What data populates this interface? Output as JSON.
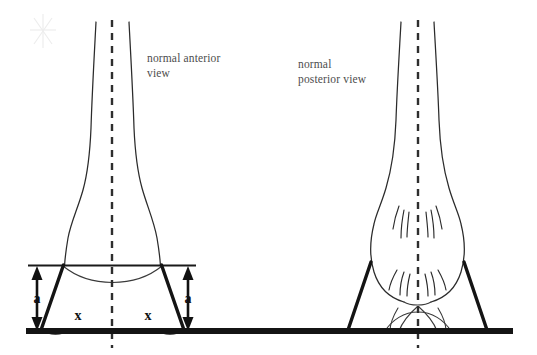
{
  "figure": {
    "background_color": "#ffffff",
    "ink_color": "#2b2b2b",
    "label_color": "#4d4d4d"
  },
  "labels": {
    "left_view_line1": "normal anterior",
    "left_view_line2": "view",
    "right_view_line1": "normal",
    "right_view_line2": "posterior  view"
  },
  "annotations": {
    "height_left": "a",
    "height_right": "a",
    "angle_left": "x",
    "angle_right": "x"
  },
  "panels": [
    {
      "name": "anterior-panel",
      "label_line1": "normal anterior",
      "label_line2": "view",
      "center_axis_x": 112,
      "has_angle_marks": true,
      "has_height_marks": true
    },
    {
      "name": "posterior-panel",
      "label_line1": "normal",
      "label_line2": "posterior  view",
      "center_axis_x": 418,
      "has_angle_marks": false,
      "has_height_marks": false
    }
  ],
  "elements": {
    "ground_line_label": "ground-line",
    "reference_line_label": "ankle-reference-line",
    "axis_label": "vertical-midline-axis",
    "left_strut_label": "heel-strut-left",
    "right_strut_label": "heel-strut-right"
  }
}
